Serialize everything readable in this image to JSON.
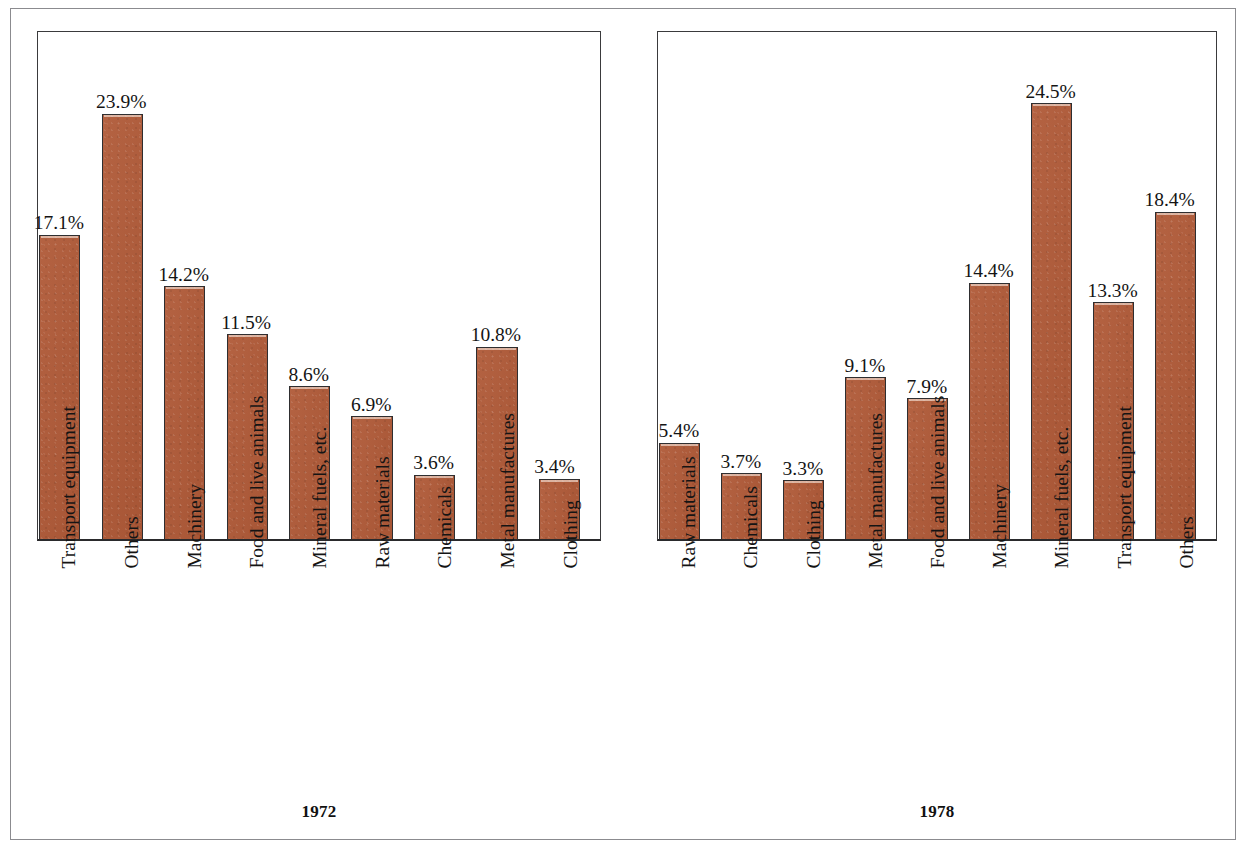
{
  "chart_data": [
    {
      "type": "bar",
      "title": "1972",
      "xlabel": "",
      "ylabel": "",
      "ylim": [
        0,
        28.5
      ],
      "grid": false,
      "legend": null,
      "value_suffix": "%",
      "categories": [
        "Transport equipment",
        "Others",
        "Machinery",
        "Food and live animals",
        "Mineral fuels, etc.",
        "Raw materials",
        "Chemicals",
        "Metal manufactures",
        "Clothing"
      ],
      "values": [
        17.1,
        23.9,
        14.2,
        11.5,
        8.6,
        6.9,
        3.6,
        10.8,
        3.4
      ],
      "value_labels": [
        "17.1%",
        "23.9%",
        "14.2%",
        "11.5%",
        "8.6%",
        "6.9%",
        "3.6%",
        "10.8%",
        "3.4%"
      ]
    },
    {
      "type": "bar",
      "title": "1978",
      "xlabel": "",
      "ylabel": "",
      "ylim": [
        0,
        28.5
      ],
      "grid": false,
      "legend": null,
      "value_suffix": "%",
      "categories": [
        "Raw materials",
        "Chemicals",
        "Clothing",
        "Metal manufactures",
        "Food and live animals",
        "Machinery",
        "Mineral fuels, etc.",
        "Transport equipment",
        "Others"
      ],
      "values": [
        5.4,
        3.7,
        3.3,
        9.1,
        7.9,
        14.4,
        24.5,
        13.3,
        18.4
      ],
      "value_labels": [
        "5.4%",
        "3.7%",
        "3.3%",
        "9.1%",
        "7.9%",
        "14.4%",
        "24.5%",
        "13.3%",
        "18.4%"
      ]
    }
  ],
  "colors": {
    "bar_fill": "#b05a38",
    "bar_border": "#2e2e30",
    "axis": "#3a3a3c",
    "page_frame": "#8b8b8f",
    "text": "#141414",
    "background": "#ffffff"
  },
  "panels": [
    {
      "id": "1972",
      "year_label": "1972"
    },
    {
      "id": "1978",
      "year_label": "1978"
    }
  ]
}
